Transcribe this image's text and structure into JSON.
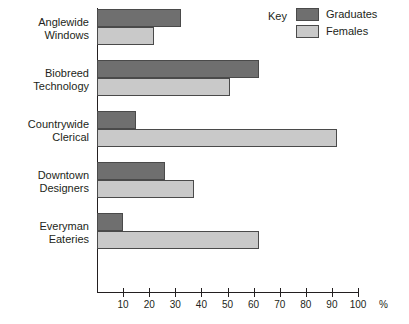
{
  "chart_data": {
    "type": "bar",
    "orientation": "horizontal",
    "title": "",
    "xlabel": "%",
    "ylabel": "",
    "xlim": [
      0,
      100
    ],
    "xticks": [
      10,
      20,
      30,
      40,
      50,
      60,
      70,
      80,
      90,
      100
    ],
    "grid": false,
    "legend_position": "top-right",
    "legend_title": "Key",
    "categories": [
      "Anglewide Windows",
      "Biobreed Technology",
      "Countrywide Clerical",
      "Downtown Designers",
      "Everyman Eateries"
    ],
    "series": [
      {
        "name": "Graduates",
        "color": "#6f6f6f",
        "values": [
          32,
          62,
          15,
          26,
          10
        ]
      },
      {
        "name": "Females",
        "color": "#c9c9c9",
        "values": [
          22,
          51,
          92,
          37,
          62
        ]
      }
    ]
  },
  "legend": {
    "title": "Key",
    "entries": [
      {
        "label": "Graduates",
        "swatch": "#6f6f6f"
      },
      {
        "label": "Females",
        "swatch": "#c9c9c9"
      }
    ]
  },
  "axis": {
    "unit": "%",
    "ticks": [
      "10",
      "20",
      "30",
      "40",
      "50",
      "60",
      "70",
      "80",
      "90",
      "100"
    ]
  },
  "categories": [
    {
      "line1": "Anglewide",
      "line2": "Windows"
    },
    {
      "line1": "Biobreed",
      "line2": "Technology"
    },
    {
      "line1": "Countrywide",
      "line2": "Clerical"
    },
    {
      "line1": "Downtown",
      "line2": "Designers"
    },
    {
      "line1": "Everyman",
      "line2": "Eateries"
    }
  ]
}
